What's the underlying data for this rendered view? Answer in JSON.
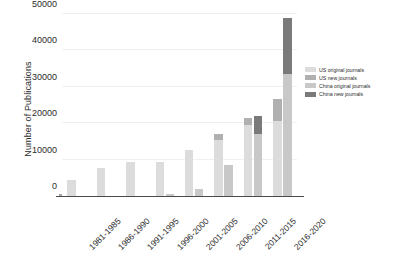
{
  "chart_data": {
    "type": "bar",
    "barmode": "stacked-grouped",
    "title": "",
    "xlabel": "",
    "ylabel": "Number of Publications",
    "categories": [
      "1981-1985",
      "1986-1990",
      "1991-1995",
      "1996-2000",
      "2001-2005",
      "2006-2010",
      "2011-2015",
      "2016-2020"
    ],
    "ylim": [
      0,
      50000
    ],
    "yticks": [
      0,
      10000,
      20000,
      30000,
      40000,
      50000
    ],
    "ytick_labels": [
      "0",
      "10000",
      "20000",
      "30000",
      "40000",
      "50000"
    ],
    "grid": true,
    "grid_axis": "y",
    "legend_position": "right",
    "series": [
      {
        "name": "US original journals",
        "group": "US",
        "stack_level": 0,
        "color": "#dcdcdc",
        "values": [
          4400,
          7700,
          9400,
          9400,
          12600,
          15400,
          19400,
          20700
        ]
      },
      {
        "name": "US new journals",
        "group": "US",
        "stack_level": 1,
        "color": "#b0b0b0",
        "values": [
          0,
          0,
          0,
          0,
          0,
          1600,
          2000,
          6000
        ]
      },
      {
        "name": "China original journals",
        "group": "China",
        "stack_level": 0,
        "color": "#c8c8c8",
        "values": [
          0,
          0,
          0,
          500,
          1900,
          8500,
          17100,
          33500
        ]
      },
      {
        "name": "China new journals",
        "group": "China",
        "stack_level": 1,
        "color": "#7a7a7a",
        "values": [
          0,
          0,
          0,
          0,
          0,
          0,
          5000,
          15500
        ]
      }
    ]
  },
  "legend": {
    "items": [
      {
        "label": "US original journals",
        "color": "#dcdcdc"
      },
      {
        "label": "US new journals",
        "color": "#b0b0b0"
      },
      {
        "label": "China original journals",
        "color": "#c8c8c8"
      },
      {
        "label": "China new journals",
        "color": "#7a7a7a"
      }
    ]
  }
}
